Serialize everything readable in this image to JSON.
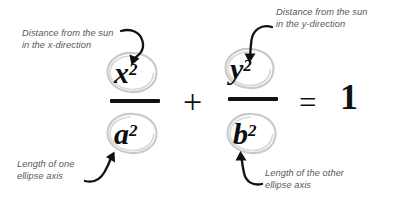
{
  "diagram": {
    "background_color": "#ffffff",
    "annotation_color": "#5a5a5a",
    "math_color": "#0d0d0d",
    "circle_color": "#c9c9c9",
    "arrow_color": "#111111"
  },
  "equation": {
    "expression": "x^2/a^2 + y^2/b^2 = 1",
    "numerator_left": {
      "base": "x",
      "exponent": "2"
    },
    "denominator_left": {
      "base": "a",
      "exponent": "2"
    },
    "numerator_right": {
      "base": "y",
      "exponent": "2"
    },
    "denominator_right": {
      "base": "b",
      "exponent": "2"
    },
    "operator_plus": "+",
    "operator_equals": "=",
    "right_hand_side": "1"
  },
  "annotations": [
    {
      "id": "x-label",
      "line1": "Distance from the sun",
      "line2": "in the x-direction",
      "points_to": "x^2"
    },
    {
      "id": "y-label",
      "line1": "Distance from the sun",
      "line2": "in the y-direction",
      "points_to": "y^2"
    },
    {
      "id": "a-label",
      "line1": "Length of one",
      "line2": "ellipse axis",
      "points_to": "a^2"
    },
    {
      "id": "b-label",
      "line1": "Length of the other",
      "line2": "ellipse axis",
      "points_to": "b^2"
    }
  ]
}
